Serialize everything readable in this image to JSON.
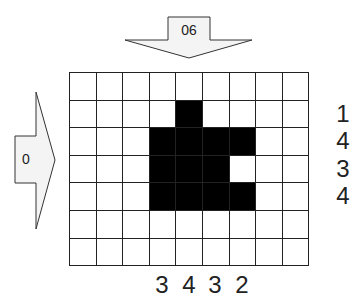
{
  "diagram": {
    "top_arrow": {
      "label": "90",
      "direction": "down",
      "label_rotation_deg": 180
    },
    "left_arrow": {
      "label": "0",
      "direction": "right"
    },
    "grid": {
      "rows": 7,
      "cols": 9,
      "filled_color": "#000000",
      "empty_color": "#ffffff",
      "cells": [
        [
          0,
          0,
          0,
          0,
          0,
          0,
          0,
          0,
          0
        ],
        [
          0,
          0,
          0,
          0,
          1,
          0,
          0,
          0,
          0
        ],
        [
          0,
          0,
          0,
          1,
          1,
          1,
          1,
          0,
          0
        ],
        [
          0,
          0,
          0,
          1,
          1,
          1,
          0,
          0,
          0
        ],
        [
          0,
          0,
          0,
          1,
          1,
          1,
          1,
          0,
          0
        ],
        [
          0,
          0,
          0,
          0,
          0,
          0,
          0,
          0,
          0
        ],
        [
          0,
          0,
          0,
          0,
          0,
          0,
          0,
          0,
          0
        ]
      ]
    },
    "row_sums": [
      {
        "row": 1,
        "value": "1"
      },
      {
        "row": 2,
        "value": "4"
      },
      {
        "row": 3,
        "value": "3"
      },
      {
        "row": 4,
        "value": "4"
      }
    ],
    "col_sums": [
      {
        "col": 3,
        "value": "3"
      },
      {
        "col": 4,
        "value": "4"
      },
      {
        "col": 5,
        "value": "3"
      },
      {
        "col": 6,
        "value": "2"
      }
    ]
  }
}
